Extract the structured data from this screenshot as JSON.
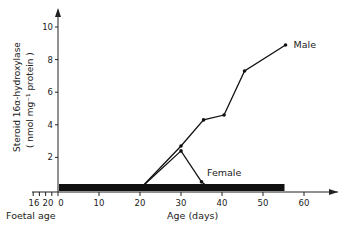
{
  "chart_data": {
    "type": "line",
    "title": "",
    "xlabel": "Age (days)",
    "ylabel_line1": "Steroid 16α-hydroxylase",
    "ylabel_line2": "( nmol mg⁻¹ protein )",
    "secondary_xlabel": "Foetal age",
    "xlim": [
      0,
      70
    ],
    "ylim": [
      0,
      11
    ],
    "x_ticks": [
      0,
      10,
      20,
      30,
      40,
      50,
      60
    ],
    "x_tick_labels": [
      "0",
      "10",
      "20",
      "30",
      "40",
      "50",
      "60"
    ],
    "foetal_ticks": [
      16,
      18,
      20,
      22
    ],
    "foetal_tick_labels": [
      "16",
      "20"
    ],
    "y_ticks": [
      2,
      4,
      6,
      8,
      10
    ],
    "y_tick_labels": [
      "2",
      "4",
      "6",
      "8",
      "10"
    ],
    "grid": false,
    "baseline_bar": {
      "x_start": 0,
      "x_end": 55,
      "description": "undetectable range"
    },
    "series": [
      {
        "name": "Male",
        "x": [
          20.5,
          30,
          35.5,
          40.5,
          45.5,
          55.5
        ],
        "y": [
          0.2,
          2.7,
          4.3,
          4.6,
          7.3,
          8.9
        ]
      },
      {
        "name": "Female",
        "x": [
          20.5,
          30,
          35,
          36.5
        ],
        "y": [
          0.2,
          2.4,
          0.5,
          0.2
        ]
      }
    ]
  }
}
